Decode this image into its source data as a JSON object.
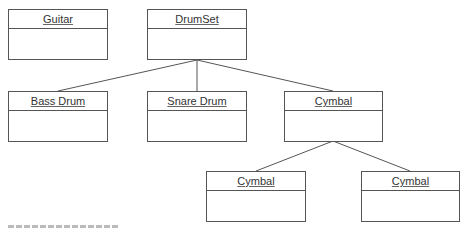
{
  "diagram": {
    "type": "UML class hierarchy",
    "classes": [
      {
        "id": "guitar",
        "name": "Guitar"
      },
      {
        "id": "drumset",
        "name": "DrumSet"
      },
      {
        "id": "bass-drum",
        "name": "Bass Drum"
      },
      {
        "id": "snare-drum",
        "name": "Snare Drum"
      },
      {
        "id": "cymbal",
        "name": "Cymbal"
      },
      {
        "id": "cymbal-child-1",
        "name": "Cymbal"
      },
      {
        "id": "cymbal-child-2",
        "name": "Cymbal"
      }
    ],
    "edges": [
      {
        "from": "drumset",
        "to": "bass-drum"
      },
      {
        "from": "drumset",
        "to": "snare-drum"
      },
      {
        "from": "drumset",
        "to": "cymbal"
      },
      {
        "from": "cymbal",
        "to": "cymbal-child-1"
      },
      {
        "from": "cymbal",
        "to": "cymbal-child-2"
      }
    ],
    "caption_visible": "partially clipped caption"
  }
}
